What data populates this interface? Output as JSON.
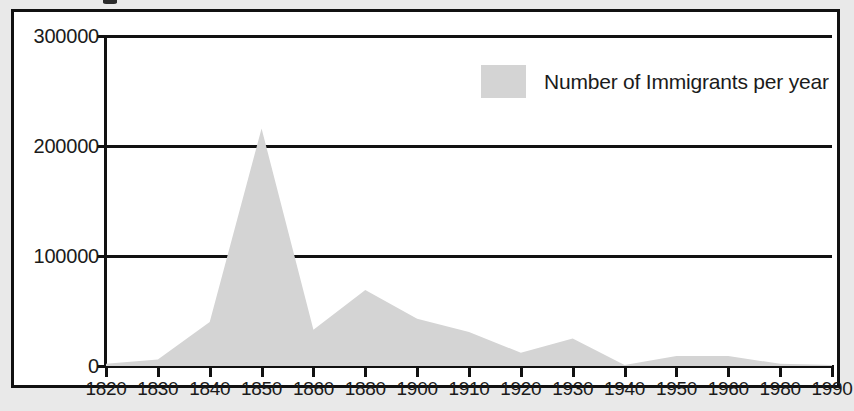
{
  "figure": {
    "legend": {
      "swatch_name": "series-color-swatch",
      "label": "Number of Immigrants per year",
      "swatch_color": "#d4d4d4"
    }
  },
  "chart_data": {
    "type": "area",
    "title": "",
    "xlabel": "",
    "ylabel": "",
    "legend": [
      "Number of Immigrants per year"
    ],
    "legend_position": "top-right-inside",
    "grid": true,
    "grid_axis": "y",
    "series_color": "#d4d4d4",
    "ylim": [
      0,
      300000
    ],
    "yticks": [
      0,
      100000,
      200000,
      300000
    ],
    "ytick_labels": [
      "0",
      "100000",
      "200000",
      "300000"
    ],
    "xtick_labels": [
      "1820",
      "1830",
      "1840",
      "1850",
      "1860",
      "1880",
      "1900",
      "1910",
      "1920",
      "1930",
      "1940",
      "1950",
      "1960",
      "1980",
      "1990"
    ],
    "x_axis_note": "categorical-evenly-spaced ticks with non-uniform year gaps",
    "categories": [
      "1820",
      "1830",
      "1840",
      "1850",
      "1860",
      "1880",
      "1900",
      "1910",
      "1920",
      "1930",
      "1940",
      "1950",
      "1960",
      "1980",
      "1990"
    ],
    "values": [
      2000,
      6000,
      40000,
      216000,
      33000,
      69000,
      43000,
      31000,
      12000,
      25000,
      1000,
      9000,
      9000,
      2000,
      1000
    ],
    "series": [
      {
        "name": "Number of Immigrants per year",
        "values": [
          2000,
          6000,
          40000,
          216000,
          33000,
          69000,
          43000,
          31000,
          12000,
          25000,
          1000,
          9000,
          9000,
          2000,
          1000
        ]
      }
    ]
  }
}
